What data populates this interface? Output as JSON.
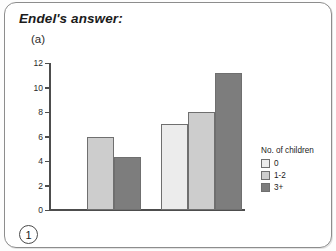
{
  "header": {
    "title": "Endel's answer:",
    "part_label": "(a)",
    "page_number": "1"
  },
  "chart_data": {
    "type": "bar",
    "title": "",
    "xlabel": "",
    "ylabel": "",
    "ylim": [
      0,
      12
    ],
    "ytick_labels": [
      "0",
      "2",
      "4",
      "6",
      "8",
      "10",
      "12"
    ],
    "yticks": [
      0,
      2,
      4,
      6,
      8,
      10,
      12
    ],
    "grid": false,
    "categories": [
      "Group 1",
      "Group 2"
    ],
    "legend_title": "No. of children",
    "legend_position": "right",
    "series": [
      {
        "name": "0",
        "color": "#ececec",
        "values": [
          null,
          7
        ]
      },
      {
        "name": "1-2",
        "color": "#cdcdcd",
        "values": [
          6,
          8
        ]
      },
      {
        "name": "3+",
        "color": "#7d7d7d",
        "values": [
          4.3,
          11.2
        ]
      }
    ],
    "bars": [
      {
        "group": 0,
        "series": "1-2",
        "value": 6,
        "color_class": "c1",
        "left": 36,
        "width": 27
      },
      {
        "group": 0,
        "series": "3+",
        "value": 4.3,
        "color_class": "c2",
        "left": 63,
        "width": 27
      },
      {
        "group": 1,
        "series": "0",
        "value": 7,
        "color_class": "c0",
        "left": 110,
        "width": 27
      },
      {
        "group": 1,
        "series": "1-2",
        "value": 8,
        "color_class": "c1",
        "left": 137,
        "width": 27
      },
      {
        "group": 1,
        "series": "3+",
        "value": 11.2,
        "color_class": "c2",
        "left": 164,
        "width": 27
      }
    ]
  },
  "legend": {
    "title": "No. of children",
    "items": [
      {
        "label": "0",
        "color": "#ececec"
      },
      {
        "label": "1-2",
        "color": "#cdcdcd"
      },
      {
        "label": "3+",
        "color": "#7d7d7d"
      }
    ]
  }
}
